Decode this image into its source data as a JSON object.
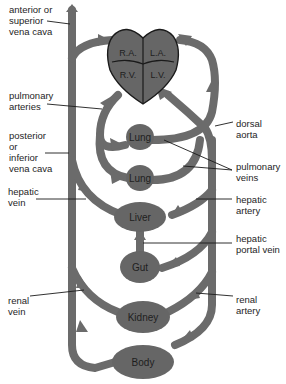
{
  "diagram": {
    "title": "",
    "heart": {
      "chambers": {
        "ra": "R.A.",
        "la": "L.A.",
        "rv": "R.V.",
        "lv": "L.V."
      }
    },
    "organs": {
      "lung_upper": "Lung",
      "lung_lower": "Lung",
      "liver": "Liver",
      "gut": "Gut",
      "kidney": "Kidney",
      "body": "Body"
    },
    "labels": {
      "anterior_vena_cava": "anterior or\nsuperior\nvena cava",
      "pulmonary_arteries": "pulmonary\narteries",
      "posterior_vena_cava": "posterior\nor\ninferior\nvena cava",
      "hepatic_vein": "hepatic\nvein",
      "renal_vein": "renal\nvein",
      "dorsal_aorta": "dorsal\naorta",
      "pulmonary_veins": "pulmonary\nveins",
      "hepatic_artery": "hepatic\nartery",
      "hepatic_portal_vein": "hepatic\nportal vein",
      "renal_artery": "renal\nartery"
    },
    "colors": {
      "vessel": "#6b6b6b",
      "organ": "#666666",
      "outline": "#1a1a1a",
      "background": "#ffffff"
    }
  }
}
